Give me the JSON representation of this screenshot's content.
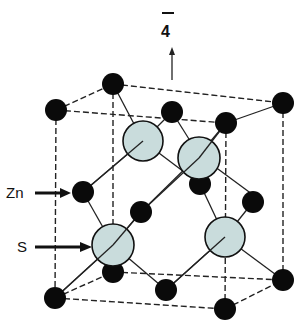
{
  "axis_label": "4",
  "axis_label_overbar": true,
  "legend": [
    {
      "label": "Zn",
      "atom": "zinc",
      "color": "#0a0a0a"
    },
    {
      "label": "S",
      "atom": "sulfur",
      "color": "#c9dcdc"
    }
  ],
  "structure": "zinc blende unit cell",
  "colors": {
    "zinc": "#0a0a0a",
    "sulfur": "#c9dcdc",
    "line": "#222222"
  }
}
